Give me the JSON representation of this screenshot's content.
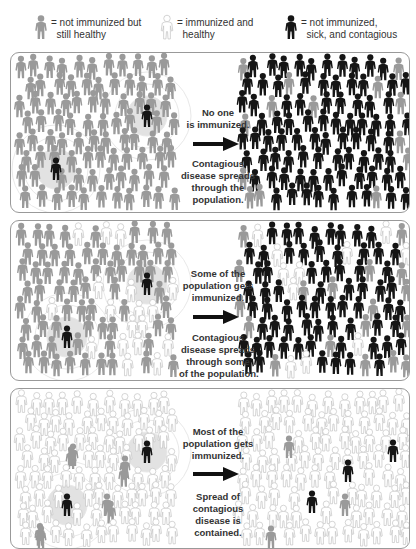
{
  "colors": {
    "not_immunized_healthy": "#9a9a9a",
    "immunized_healthy": "#ffffff",
    "immunized_outline": "#c4c4c4",
    "sick_contagious": "#151515",
    "panel_border": "#999999",
    "halo": "#e6e6e6"
  },
  "legend": [
    {
      "icon": "gray-person-icon",
      "kind": "gray",
      "label": "= not immunized but\n  still healthy"
    },
    {
      "icon": "white-person-icon",
      "kind": "white",
      "label": "= immunized and\n  healthy"
    },
    {
      "icon": "black-person-icon",
      "kind": "black",
      "label": "= not immunized,\n  sick, and contagious"
    }
  ],
  "panels": [
    {
      "name": "no-immunization",
      "caption_top": "No one\nis immunized.",
      "caption_bottom": "Contagious\ndisease spreads\nthrough the\npopulation.",
      "before": {
        "white_ratio": 0.0,
        "sick_at": [
          [
            45,
            108
          ],
          [
            136,
            55
          ]
        ]
      },
      "after": {
        "pattern": "mostly-sick",
        "healthy_ratio": 0.12
      }
    },
    {
      "name": "some-immunization",
      "caption_top": "Some of the\npopulation gets\nimmunized.",
      "caption_bottom": "Contagious\ndisease spreads\nthrough some\nof the population.",
      "before": {
        "white_ratio": 0.2,
        "sick_at": [
          [
            56,
            108
          ],
          [
            136,
            55
          ]
        ]
      },
      "after": {
        "pattern": "mostly-sick-some-immune",
        "healthy_ratio": 0.1,
        "white_ratio": 0.12
      }
    },
    {
      "name": "most-immunization",
      "caption_top": "Most of the\npopulation gets\nimmunized.",
      "caption_bottom": "Spread of\ncontagious\ndisease is\ncontained.",
      "before": {
        "white_ratio": 0.92,
        "sick_at": [
          [
            56,
            108
          ],
          [
            136,
            55
          ]
        ],
        "gray_at": [
          [
            62,
            58
          ],
          [
            114,
            70
          ],
          [
            96,
            108
          ],
          [
            30,
            140
          ]
        ]
      },
      "after": {
        "pattern": "mostly-immune",
        "sick_at": [
          [
            111,
            74
          ],
          [
            156,
            54
          ],
          [
            75,
            105
          ]
        ],
        "gray_at": [
          [
            52,
            50
          ],
          [
            108,
            108
          ],
          [
            34,
            140
          ]
        ]
      }
    }
  ]
}
